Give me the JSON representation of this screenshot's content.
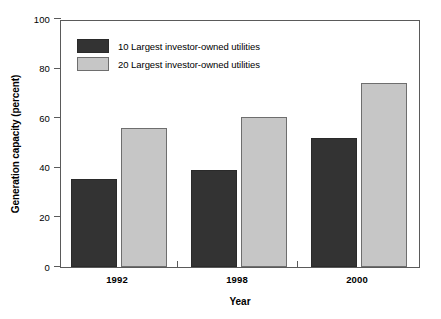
{
  "chart_data": {
    "type": "bar",
    "title": "",
    "subtitle": "",
    "xlabel": "Year",
    "ylabel": "Generation capacity (percent)",
    "categories": [
      "1992",
      "1998",
      "2000"
    ],
    "series": [
      {
        "name": "10 Largest investor-owned utilities",
        "color": "#333333",
        "values": [
          35.5,
          39.0,
          52.0
        ]
      },
      {
        "name": "20 Largest investor-owned utilities",
        "color": "#c6c6c6",
        "values": [
          56.0,
          60.5,
          74.0
        ]
      }
    ],
    "ylim": [
      0,
      100
    ],
    "yticks": [
      0,
      20,
      40,
      60,
      80,
      100
    ],
    "ytick_labels": [
      "0",
      "20",
      "40",
      "60",
      "80",
      "100"
    ],
    "grid": false,
    "legend_position": "top-left",
    "frame": true
  },
  "legend": {
    "entries": [
      {
        "label": "10 Largest investor-owned utilities"
      },
      {
        "label": "20 Largest investor-owned utilities"
      }
    ]
  },
  "axes": {
    "y_title": "Generation capacity (percent)",
    "x_title": "Year"
  }
}
